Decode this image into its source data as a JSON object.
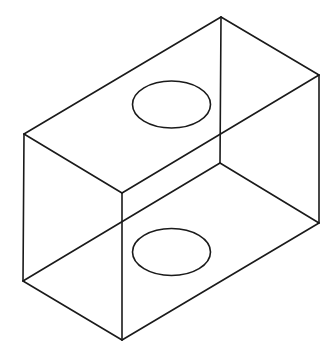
{
  "diagram": {
    "type": "isometric-wireframe-box",
    "stroke_color": "#1a1a1a",
    "background_color": "#ffffff",
    "vertices": {
      "top_back": [
        221,
        17
      ],
      "top_left": [
        24,
        134
      ],
      "top_front": [
        122,
        193
      ],
      "top_right": [
        319,
        75
      ],
      "bottom_back": [
        220,
        163
      ],
      "bottom_left": [
        23,
        281
      ],
      "bottom_front": [
        122,
        340
      ],
      "bottom_right": [
        319,
        223
      ]
    },
    "edges": [
      {
        "name": "top-back-right",
        "from": [
          221,
          17
        ],
        "to": [
          319,
          75
        ]
      },
      {
        "name": "top-back-left",
        "from": [
          221,
          17
        ],
        "to": [
          24,
          134
        ]
      },
      {
        "name": "top-front-left",
        "from": [
          24,
          134
        ],
        "to": [
          122,
          193
        ]
      },
      {
        "name": "top-front-right",
        "from": [
          122,
          193
        ],
        "to": [
          319,
          75
        ]
      },
      {
        "name": "vertical-back",
        "from": [
          221,
          17
        ],
        "to": [
          220,
          163
        ]
      },
      {
        "name": "vertical-left",
        "from": [
          24,
          134
        ],
        "to": [
          23,
          281
        ]
      },
      {
        "name": "vertical-front",
        "from": [
          122,
          193
        ],
        "to": [
          122,
          340
        ]
      },
      {
        "name": "vertical-right",
        "from": [
          319,
          75
        ],
        "to": [
          319,
          223
        ]
      },
      {
        "name": "bottom-front-left",
        "from": [
          23,
          281
        ],
        "to": [
          122,
          340
        ]
      },
      {
        "name": "bottom-front-right",
        "from": [
          122,
          340
        ],
        "to": [
          319,
          223
        ]
      },
      {
        "name": "bottom-back-left",
        "from": [
          23,
          281
        ],
        "to": [
          220,
          163
        ]
      },
      {
        "name": "bottom-back-right",
        "from": [
          220,
          163
        ],
        "to": [
          319,
          223
        ]
      }
    ],
    "holes": [
      {
        "name": "top-hole",
        "cx": 171.5,
        "cy": 104.5,
        "rx": 39,
        "ry": 23.5
      },
      {
        "name": "bottom-hole",
        "cx": 171.5,
        "cy": 252,
        "rx": 39,
        "ry": 23.5
      }
    ]
  }
}
